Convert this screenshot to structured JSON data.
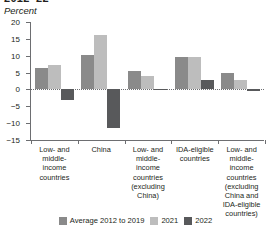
{
  "figure": {
    "title_fragment": "2012–22",
    "unit_label": "Percent"
  },
  "legend": {
    "position": "bottom-center",
    "items": [
      {
        "label": "Average 2012 to 2019",
        "color": "#8a8a8a"
      },
      {
        "label": "2021",
        "color": "#bdbdbd"
      },
      {
        "label": "2022",
        "color": "#58595b"
      }
    ]
  },
  "yaxis": {
    "ticks": [
      "20",
      "15",
      "10",
      "5",
      "0",
      "−5",
      "−10",
      "−15"
    ],
    "values": [
      20,
      15,
      10,
      5,
      0,
      -5,
      -10,
      -15
    ]
  },
  "chart_data": {
    "type": "bar",
    "title": "2012–22",
    "xlabel": "",
    "ylabel": "Percent",
    "ylim": [
      -15,
      20
    ],
    "grid": false,
    "zero_line": true,
    "legend_position": "bottom",
    "categories": [
      "Low- and middle-income countries",
      "China",
      "Low- and middle-income countries (excluding China)",
      "IDA-eligible countries",
      "Low- and middle-income countries (excluding China and IDA-eligible countries)"
    ],
    "series": [
      {
        "name": "Average 2012 to 2019",
        "color": "#8a8a8a",
        "values": [
          6.4,
          10.3,
          5.4,
          9.6,
          4.9
        ]
      },
      {
        "name": "2021",
        "color": "#bdbdbd",
        "values": [
          7.3,
          16.2,
          4.0,
          9.7,
          2.9
        ]
      },
      {
        "name": "2022",
        "color": "#58595b",
        "values": [
          -3.0,
          -11.5,
          -0.2,
          2.7,
          -0.4
        ]
      }
    ]
  }
}
